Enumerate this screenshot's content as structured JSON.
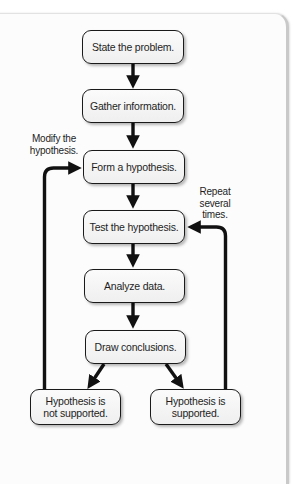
{
  "diagram": {
    "type": "flowchart",
    "steps": [
      {
        "id": "state",
        "label": "State the problem."
      },
      {
        "id": "gather",
        "label": "Gather information."
      },
      {
        "id": "form",
        "label": "Form a hypothesis."
      },
      {
        "id": "test",
        "label": "Test the hypothesis."
      },
      {
        "id": "analyze",
        "label": "Analyze data."
      },
      {
        "id": "draw",
        "label": "Draw conclusions."
      }
    ],
    "outcomes": {
      "not_supported": {
        "line1": "Hypothesis is",
        "line2": "not supported."
      },
      "supported": {
        "line1": "Hypothesis is",
        "line2": "supported."
      }
    },
    "notes": {
      "modify": {
        "line1": "Modify the",
        "line2": "hypothesis."
      },
      "repeat": {
        "line1": "Repeat",
        "line2": "several",
        "line3": "times."
      }
    },
    "edges": [
      {
        "from": "state",
        "to": "gather"
      },
      {
        "from": "gather",
        "to": "form"
      },
      {
        "from": "form",
        "to": "test"
      },
      {
        "from": "test",
        "to": "analyze"
      },
      {
        "from": "analyze",
        "to": "draw"
      },
      {
        "from": "draw",
        "to": "not_supported"
      },
      {
        "from": "draw",
        "to": "supported"
      },
      {
        "from": "not_supported",
        "to": "form",
        "label": "Modify the hypothesis."
      },
      {
        "from": "supported",
        "to": "test",
        "label": "Repeat several times."
      }
    ],
    "colors": {
      "stroke": "#111111",
      "box_fill": "#f4f4f4",
      "card_border": "#c9c9c9"
    }
  }
}
